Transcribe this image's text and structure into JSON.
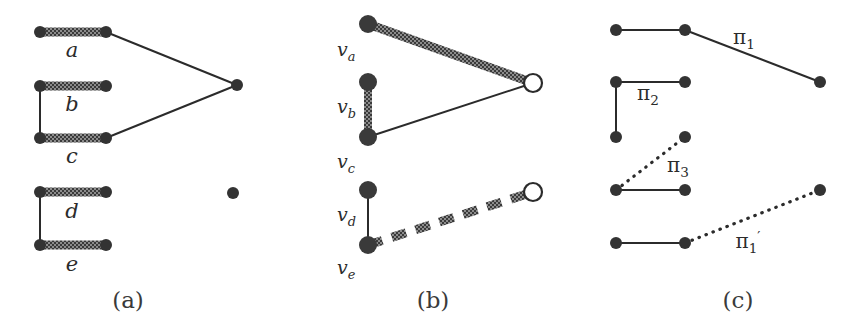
{
  "figure": {
    "background_color": "#ffffff",
    "ink_color": "#2b2b2b",
    "node_fill": "#333333",
    "hollow_node_fill": "#ffffff",
    "thick_edge_color": "#555555"
  },
  "captions": {
    "a": "(a)",
    "b": "(b)",
    "c": "(c)"
  },
  "panel_a": {
    "edge_labels": {
      "a": "a",
      "b": "b",
      "c": "c",
      "d": "d",
      "e": "e"
    },
    "nodes": [
      {
        "name": "a-left",
        "x": 40,
        "y": 32,
        "style": "filled"
      },
      {
        "name": "a-right",
        "x": 106,
        "y": 32,
        "style": "filled"
      },
      {
        "name": "b-left",
        "x": 40,
        "y": 86,
        "style": "filled"
      },
      {
        "name": "b-right",
        "x": 106,
        "y": 86,
        "style": "filled"
      },
      {
        "name": "c-left",
        "x": 40,
        "y": 138,
        "style": "filled"
      },
      {
        "name": "c-right",
        "x": 106,
        "y": 138,
        "style": "filled"
      },
      {
        "name": "apex",
        "x": 237,
        "y": 85,
        "style": "filled"
      },
      {
        "name": "d-left",
        "x": 40,
        "y": 192,
        "style": "filled"
      },
      {
        "name": "d-right",
        "x": 106,
        "y": 192,
        "style": "filled"
      },
      {
        "name": "e-left",
        "x": 40,
        "y": 245,
        "style": "filled"
      },
      {
        "name": "e-right",
        "x": 106,
        "y": 245,
        "style": "filled"
      },
      {
        "name": "isolated",
        "x": 233,
        "y": 193,
        "style": "filled"
      }
    ],
    "edges": [
      {
        "name": "edge-a",
        "from": "a-left",
        "to": "a-right",
        "style": "thick-hatched"
      },
      {
        "name": "edge-b",
        "from": "b-left",
        "to": "b-right",
        "style": "thick-hatched"
      },
      {
        "name": "edge-c",
        "from": "c-left",
        "to": "c-right",
        "style": "thick-hatched"
      },
      {
        "name": "edge-d",
        "from": "d-left",
        "to": "d-right",
        "style": "thick-hatched"
      },
      {
        "name": "edge-e",
        "from": "e-left",
        "to": "e-right",
        "style": "thick-hatched"
      },
      {
        "name": "edge-bc",
        "from": "b-left",
        "to": "c-left",
        "style": "thin-solid"
      },
      {
        "name": "edge-de",
        "from": "d-left",
        "to": "e-left",
        "style": "thin-solid"
      },
      {
        "name": "edge-a-apex",
        "from": "a-right",
        "to": "apex",
        "style": "thin-solid"
      },
      {
        "name": "edge-c-apex",
        "from": "c-right",
        "to": "apex",
        "style": "thin-solid"
      }
    ]
  },
  "panel_b": {
    "vertex_labels": {
      "va": "v",
      "va_sub": "a",
      "vb": "v",
      "vb_sub": "b",
      "vc": "v",
      "vc_sub": "c",
      "vd": "v",
      "vd_sub": "d",
      "ve": "v",
      "ve_sub": "e"
    },
    "nodes": [
      {
        "name": "v-a",
        "x": 368,
        "y": 24,
        "style": "filled"
      },
      {
        "name": "v-b",
        "x": 368,
        "y": 82,
        "style": "filled"
      },
      {
        "name": "v-c",
        "x": 368,
        "y": 137,
        "style": "filled"
      },
      {
        "name": "hub-top",
        "x": 533,
        "y": 83,
        "style": "hollow"
      },
      {
        "name": "v-d",
        "x": 368,
        "y": 190,
        "style": "filled"
      },
      {
        "name": "v-e",
        "x": 368,
        "y": 245,
        "style": "filled"
      },
      {
        "name": "hub-bottom",
        "x": 533,
        "y": 192,
        "style": "hollow"
      }
    ],
    "edges": [
      {
        "name": "edge-va-hub",
        "from": "v-a",
        "to": "hub-top",
        "style": "thick-hatched"
      },
      {
        "name": "edge-vb-vc",
        "from": "v-b",
        "to": "v-c",
        "style": "thick-hatched"
      },
      {
        "name": "edge-vc-hub",
        "from": "v-c",
        "to": "hub-top",
        "style": "thin-solid"
      },
      {
        "name": "edge-vd-ve",
        "from": "v-d",
        "to": "v-e",
        "style": "thin-solid"
      },
      {
        "name": "edge-ve-hub",
        "from": "v-e",
        "to": "hub-bottom",
        "style": "thick-dashed"
      }
    ]
  },
  "panel_c": {
    "path_labels": {
      "pi1": "π",
      "pi1_sub": "1",
      "pi2": "π",
      "pi2_sub": "2",
      "pi3": "π",
      "pi3_sub": "3",
      "pi1prime": "π",
      "pi1prime_sub": "1",
      "pi1prime_prime": "′"
    },
    "nodes": [
      {
        "name": "c-r1-left",
        "x": 616,
        "y": 30,
        "style": "filled"
      },
      {
        "name": "c-r1-mid",
        "x": 685,
        "y": 30,
        "style": "filled"
      },
      {
        "name": "c-r1-right",
        "x": 820,
        "y": 82,
        "style": "filled"
      },
      {
        "name": "c-r2-left",
        "x": 616,
        "y": 82,
        "style": "filled"
      },
      {
        "name": "c-r2-right",
        "x": 685,
        "y": 82,
        "style": "filled"
      },
      {
        "name": "c-r3-left",
        "x": 616,
        "y": 137,
        "style": "filled"
      },
      {
        "name": "c-r3-right",
        "x": 685,
        "y": 137,
        "style": "filled"
      },
      {
        "name": "c-r4-left",
        "x": 616,
        "y": 190,
        "style": "filled"
      },
      {
        "name": "c-r4-right",
        "x": 685,
        "y": 190,
        "style": "filled"
      },
      {
        "name": "c-r5-left",
        "x": 616,
        "y": 243,
        "style": "filled"
      },
      {
        "name": "c-r5-mid",
        "x": 685,
        "y": 243,
        "style": "filled"
      },
      {
        "name": "c-r5-right",
        "x": 820,
        "y": 190,
        "style": "filled"
      }
    ],
    "edges": [
      {
        "name": "edge-c-r1",
        "from": "c-r1-left",
        "to": "c-r1-mid",
        "style": "thin-solid"
      },
      {
        "name": "edge-c-pi1",
        "from": "c-r1-mid",
        "to": "c-r1-right",
        "style": "thin-solid"
      },
      {
        "name": "edge-c-r2",
        "from": "c-r2-left",
        "to": "c-r2-right",
        "style": "thin-solid"
      },
      {
        "name": "edge-c-pi2-vert",
        "from": "c-r2-left",
        "to": "c-r3-left",
        "style": "thin-solid"
      },
      {
        "name": "edge-c-pi3",
        "from": "c-r4-left",
        "to": "c-r3-right",
        "style": "dotted"
      },
      {
        "name": "edge-c-r4",
        "from": "c-r4-left",
        "to": "c-r4-right",
        "style": "thin-solid"
      },
      {
        "name": "edge-c-r5",
        "from": "c-r5-left",
        "to": "c-r5-mid",
        "style": "thin-solid"
      },
      {
        "name": "edge-c-pi1prime",
        "from": "c-r5-mid",
        "to": "c-r5-right",
        "style": "dotted"
      }
    ]
  }
}
